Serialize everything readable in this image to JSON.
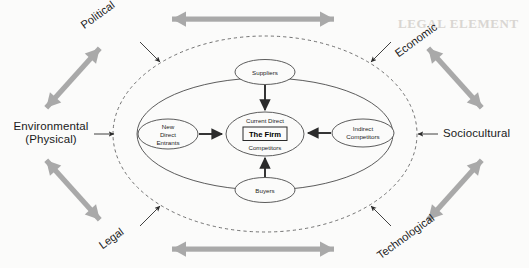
{
  "diagram": {
    "colors": {
      "arrow_gray": "#a9a9a9",
      "stroke_dark": "#2b2b2b",
      "ellipse_stroke": "#4a4a4a",
      "background": "#fbfbfa",
      "text": "#1a1a1a"
    },
    "macro_environment": {
      "label_group": "macro-environment-factors",
      "factors": [
        {
          "id": "political",
          "label": "Political",
          "position": "top-left",
          "rotated": true,
          "rotation_deg": -36
        },
        {
          "id": "economic",
          "label": "Economic",
          "position": "top-right",
          "rotated": true,
          "rotation_deg": -36
        },
        {
          "id": "sociocultural",
          "label": "Sociocultural",
          "position": "right",
          "rotated": false,
          "rotation_deg": 0
        },
        {
          "id": "technological",
          "label": "Technological",
          "position": "bottom-right",
          "rotated": true,
          "rotation_deg": -36
        },
        {
          "id": "legal",
          "label": "Legal",
          "position": "bottom-left",
          "rotated": true,
          "rotation_deg": -36
        },
        {
          "id": "environmental",
          "label": "Environmental\n(Physical)",
          "label_line1": "Environmental",
          "label_line2": "(Physical)",
          "position": "left",
          "rotated": false,
          "rotation_deg": 0
        }
      ]
    },
    "task_environment": {
      "boundary": "dashed-ellipse",
      "inner_boundary": "solid-ellipse",
      "nodes": [
        {
          "id": "suppliers",
          "label": "Suppliers",
          "lines": [
            "Suppliers"
          ],
          "position": "top"
        },
        {
          "id": "new-direct-entrants",
          "label": "New Direct Entrants",
          "lines": [
            "New",
            "Direct",
            "Entrants"
          ],
          "position": "left"
        },
        {
          "id": "indirect-competitors",
          "label": "Indirect Competitors",
          "lines": [
            "Indirect",
            "Competitors"
          ],
          "position": "right"
        },
        {
          "id": "buyers",
          "label": "Buyers",
          "lines": [
            "Buyers"
          ],
          "position": "bottom"
        }
      ]
    },
    "center": {
      "id": "current-direct-competitors",
      "top_label": "Current Direct",
      "bottom_label": "Competitors",
      "firm_label": "The Firm"
    },
    "connectors": {
      "double_headed_gray": [
        {
          "id": "top-horizontal",
          "orientation": "horizontal"
        },
        {
          "id": "bottom-horizontal",
          "orientation": "horizontal"
        },
        {
          "id": "upper-left-diagonal",
          "orientation": "diagonal"
        },
        {
          "id": "upper-right-diagonal",
          "orientation": "diagonal"
        },
        {
          "id": "lower-left-diagonal",
          "orientation": "diagonal"
        },
        {
          "id": "lower-right-diagonal",
          "orientation": "diagonal"
        }
      ],
      "thin_inward": [
        {
          "id": "political-to-boundary"
        },
        {
          "id": "economic-to-boundary"
        },
        {
          "id": "legal-to-boundary"
        },
        {
          "id": "technological-to-boundary"
        },
        {
          "id": "environmental-to-boundary"
        },
        {
          "id": "sociocultural-to-boundary"
        }
      ],
      "thick_to_center": [
        {
          "id": "suppliers-to-firm"
        },
        {
          "id": "new-direct-entrants-to-firm"
        },
        {
          "id": "indirect-competitors-to-firm"
        },
        {
          "id": "buyers-to-firm"
        }
      ]
    },
    "bleed_through_text": [
      {
        "id": "bleed-heading",
        "text": "LEGAL ELEMENT"
      }
    ]
  }
}
